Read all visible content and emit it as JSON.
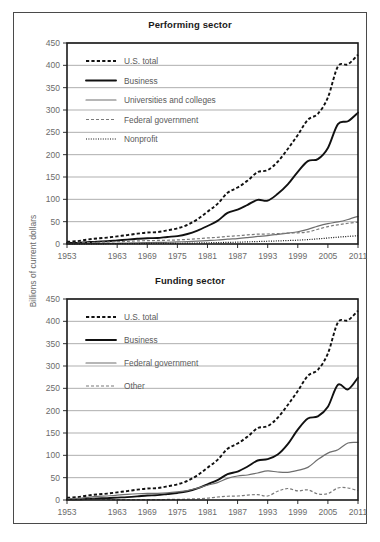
{
  "figure": {
    "y_axis_label": "Billions of current dollars"
  },
  "chart_data": [
    {
      "type": "line",
      "title": "Performing sector",
      "xlabel": "",
      "ylabel": "Billions of current dollars",
      "xlim": [
        1953,
        2011
      ],
      "ylim": [
        0,
        450
      ],
      "ytick_labels": [
        "0",
        "50",
        "100",
        "150",
        "200",
        "250",
        "300",
        "350",
        "400",
        "450"
      ],
      "yticks": [
        0,
        50,
        100,
        150,
        200,
        250,
        300,
        350,
        400,
        450
      ],
      "xtick_labels": [
        "1953",
        "1963",
        "1969",
        "1975",
        "1981",
        "1987",
        "1993",
        "1999",
        "2005",
        "2011"
      ],
      "xticks": [
        1953,
        1963,
        1969,
        1975,
        1981,
        1987,
        1993,
        1999,
        2005,
        2011
      ],
      "grid": true,
      "legend_position": "upper left",
      "x": [
        1953,
        1955,
        1957,
        1959,
        1961,
        1963,
        1965,
        1967,
        1969,
        1971,
        1973,
        1975,
        1977,
        1979,
        1981,
        1983,
        1985,
        1987,
        1989,
        1991,
        1993,
        1995,
        1997,
        1999,
        2001,
        2003,
        2005,
        2007,
        2009,
        2011
      ],
      "series": [
        {
          "name": "U.S. total",
          "style": "dashed",
          "values": [
            5.2,
            6.3,
            9.9,
            12.5,
            14.3,
            17.1,
            20.0,
            23.1,
            25.6,
            26.7,
            30.4,
            35.2,
            42.8,
            55.4,
            72.3,
            89.9,
            114.7,
            126.4,
            141.9,
            160.9,
            165.4,
            184.1,
            212.7,
            244.1,
            278.2,
            291.5,
            328.1,
            397.6,
            402.3,
            423.8
          ]
        },
        {
          "name": "Business",
          "style": "solid-thick",
          "values": [
            2.2,
            2.5,
            4.0,
            5.4,
            6.3,
            8.1,
            9.8,
            11.6,
            13.0,
            13.3,
            15.8,
            17.7,
            22.3,
            30.0,
            40.3,
            51.7,
            69.6,
            77.1,
            87.8,
            98.7,
            97.0,
            112.3,
            133.4,
            161.6,
            185.6,
            190.0,
            215.0,
            268.4,
            274.9,
            294.1
          ]
        },
        {
          "name": "Universities and colleges",
          "style": "solid-thin",
          "values": [
            0.4,
            0.5,
            0.7,
            0.9,
            1.2,
            1.6,
            2.2,
            2.8,
            3.2,
            3.5,
            3.9,
            4.6,
            5.5,
            6.6,
            7.7,
            8.9,
            10.8,
            12.2,
            14.4,
            16.9,
            18.9,
            21.6,
            24.4,
            27.5,
            32.7,
            40.1,
            45.8,
            49.4,
            54.9,
            62.0
          ]
        },
        {
          "name": "Federal government",
          "style": "dashed-thin",
          "values": [
            1.4,
            1.8,
            2.9,
            3.6,
            4.5,
            5.2,
            5.9,
            6.9,
            7.5,
            7.9,
            8.4,
            9.1,
            10.3,
            11.8,
            13.5,
            15.0,
            17.0,
            18.5,
            20.4,
            22.0,
            22.4,
            23.1,
            24.3,
            25.0,
            27.0,
            33.0,
            39.0,
            43.0,
            46.5,
            49.0
          ]
        },
        {
          "name": "Nonprofit",
          "style": "dotted",
          "values": [
            0.2,
            0.2,
            0.3,
            0.4,
            0.5,
            0.6,
            0.8,
            1.0,
            1.2,
            1.3,
            1.4,
            1.6,
            1.9,
            2.3,
            2.7,
            3.1,
            3.6,
            4.1,
            4.8,
            5.5,
            6.2,
            6.9,
            7.7,
            8.6,
            9.8,
            11.5,
            13.4,
            15.3,
            17.0,
            18.5
          ]
        }
      ]
    },
    {
      "type": "line",
      "title": "Funding sector",
      "xlabel": "",
      "ylabel": "Billions of current dollars",
      "xlim": [
        1953,
        2011
      ],
      "ylim": [
        0,
        450
      ],
      "ytick_labels": [
        "0",
        "50",
        "100",
        "150",
        "200",
        "250",
        "300",
        "350",
        "400",
        "450"
      ],
      "yticks": [
        0,
        50,
        100,
        150,
        200,
        250,
        300,
        350,
        400,
        450
      ],
      "xtick_labels": [
        "1953",
        "1963",
        "1969",
        "1975",
        "1981",
        "1987",
        "1993",
        "1999",
        "2005",
        "2011"
      ],
      "xticks": [
        1953,
        1963,
        1969,
        1975,
        1981,
        1987,
        1993,
        1999,
        2005,
        2011
      ],
      "grid": true,
      "legend_position": "upper left",
      "x": [
        1953,
        1955,
        1957,
        1959,
        1961,
        1963,
        1965,
        1967,
        1969,
        1971,
        1973,
        1975,
        1977,
        1979,
        1981,
        1983,
        1985,
        1987,
        1989,
        1991,
        1993,
        1995,
        1997,
        1999,
        2001,
        2003,
        2005,
        2007,
        2009,
        2011
      ],
      "series": [
        {
          "name": "U.S. total",
          "style": "dashed",
          "values": [
            5.2,
            6.3,
            9.9,
            12.5,
            14.3,
            17.1,
            20.0,
            23.1,
            25.6,
            26.7,
            30.4,
            35.2,
            42.8,
            55.4,
            72.3,
            89.9,
            114.7,
            126.4,
            141.9,
            160.9,
            165.4,
            184.1,
            212.7,
            244.1,
            278.2,
            291.5,
            328.1,
            397.6,
            402.3,
            423.8
          ]
        },
        {
          "name": "Business",
          "style": "solid-thick",
          "values": [
            1.4,
            1.7,
            2.5,
            3.4,
            4.2,
            5.4,
            6.5,
            8.1,
            10.0,
            10.9,
            13.3,
            15.8,
            19.6,
            26.1,
            35.2,
            44.4,
            57.9,
            63.7,
            74.9,
            88.4,
            91.5,
            101.7,
            125.0,
            157.5,
            182.4,
            187.2,
            208.7,
            258.1,
            247.7,
            274.0
          ]
        },
        {
          "name": "Federal government",
          "style": "solid-thin",
          "values": [
            2.8,
            3.5,
            5.8,
            8.0,
            9.0,
            10.9,
            12.6,
            14.0,
            14.9,
            15.0,
            15.9,
            18.1,
            21.1,
            26.6,
            33.1,
            38.8,
            48.4,
            53.8,
            56.0,
            60.5,
            65.0,
            62.7,
            62.0,
            66.3,
            73.1,
            90.6,
            105.0,
            112.6,
            127.7,
            128.9
          ]
        },
        {
          "name": "Other",
          "style": "dashed-thin",
          "values": [
            1.0,
            1.1,
            1.6,
            1.1,
            1.1,
            0.8,
            0.9,
            1.0,
            0.7,
            0.8,
            1.2,
            1.3,
            2.1,
            2.7,
            4.0,
            6.7,
            8.4,
            8.9,
            11.0,
            12.0,
            8.9,
            19.7,
            25.7,
            20.3,
            22.7,
            13.7,
            14.4,
            26.9,
            26.9,
            20.9
          ]
        }
      ]
    }
  ]
}
